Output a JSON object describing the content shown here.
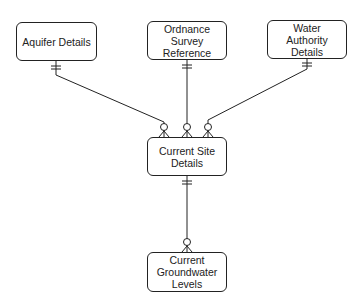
{
  "diagram": {
    "type": "entity-relationship",
    "entities": [
      {
        "id": "aquifer",
        "label": "Aquifer Details"
      },
      {
        "id": "ordnance",
        "label": "Ordnance\nSurvey\nReference"
      },
      {
        "id": "water",
        "label": "Water\nAuthority\nDetails"
      },
      {
        "id": "site",
        "label": "Current Site\nDetails"
      },
      {
        "id": "groundwater",
        "label": "Current\nGroundwater\nLevels"
      }
    ],
    "relationships": [
      {
        "from": "aquifer",
        "from_card": "one-and-only-one",
        "to": "site",
        "to_card": "zero-or-many"
      },
      {
        "from": "ordnance",
        "from_card": "one-and-only-one",
        "to": "site",
        "to_card": "zero-or-many"
      },
      {
        "from": "water",
        "from_card": "one-and-only-one",
        "to": "site",
        "to_card": "zero-or-many"
      },
      {
        "from": "site",
        "from_card": "one-and-only-one",
        "to": "groundwater",
        "to_card": "zero-or-many"
      }
    ]
  }
}
